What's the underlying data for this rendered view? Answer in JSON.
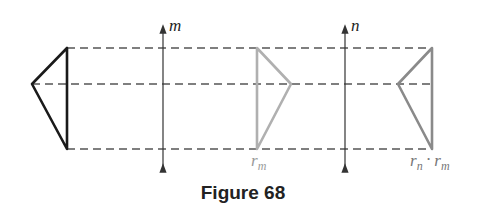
{
  "figure": {
    "caption": "Figure 68",
    "axes": [
      {
        "label": "m",
        "x": 163
      },
      {
        "label": "n",
        "x": 345
      }
    ],
    "triangles": [
      {
        "name": "original",
        "label": "",
        "color": "#1a1a1a"
      },
      {
        "name": "reflection-m",
        "label": "r_m",
        "color": "#b0b0b0"
      },
      {
        "name": "reflection-n-of-m",
        "label": "r_n · r_m",
        "color": "#8a8a8a"
      }
    ],
    "labels": {
      "m": "m",
      "n": "n",
      "r": "r",
      "sub_m": "m",
      "sub_n": "n",
      "dot": "·"
    }
  }
}
